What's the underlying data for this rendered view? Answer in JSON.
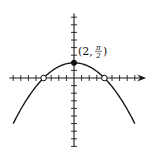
{
  "chart_data": {
    "type": "line",
    "title": "",
    "xlabel": "",
    "ylabel": "",
    "xlim": [
      -8.5,
      9.5
    ],
    "ylim": [
      -9,
      8.5
    ],
    "grid": false,
    "x_ticks_step": 1,
    "y_ticks_step": 1,
    "x_axis_arrow": true,
    "series": [
      {
        "name": "curve",
        "function": "y = 2 - x^2/8",
        "x_range": [
          -8,
          8
        ]
      }
    ],
    "points": [
      {
        "name": "vertex",
        "x": 0,
        "y": 2,
        "style": "filled"
      },
      {
        "name": "left-intercept",
        "x": -4,
        "y": 0,
        "style": "open"
      },
      {
        "name": "right-intercept",
        "x": 4,
        "y": 0,
        "style": "open"
      }
    ],
    "annotations": [
      {
        "name": "vertex-label",
        "text_open": "(2,",
        "numerator": "π",
        "denominator": "2",
        "text_close": ")"
      }
    ]
  }
}
